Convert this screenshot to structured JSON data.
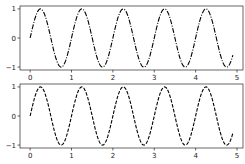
{
  "chart_data": [
    {
      "type": "line",
      "title": "",
      "xlabel": "",
      "ylabel": "",
      "xlim": [
        -0.245,
        5.145
      ],
      "ylim": [
        -1.1,
        1.1
      ],
      "xticks": [
        0,
        1,
        2,
        3,
        4,
        5
      ],
      "xtick_labels": [
        "0",
        "1",
        "2",
        "3",
        "4",
        "5"
      ],
      "yticks": [
        -1,
        0,
        1
      ],
      "ytick_labels": [
        "−1",
        "0",
        "1"
      ],
      "grid": false,
      "legend": null,
      "series": [
        {
          "name": "sin(2πx)",
          "function": "sin(2*pi*x)",
          "x_range": [
            0,
            4.9
          ],
          "linestyle": "dashdot",
          "color": "#000000"
        }
      ]
    },
    {
      "type": "line",
      "title": "",
      "xlabel": "",
      "ylabel": "",
      "xlim": [
        -0.245,
        5.145
      ],
      "ylim": [
        -1.1,
        1.1
      ],
      "xticks": [
        0,
        1,
        2,
        3,
        4,
        5
      ],
      "xtick_labels": [
        "0",
        "1",
        "2",
        "3",
        "4",
        "5"
      ],
      "yticks": [
        -1,
        0,
        1
      ],
      "ytick_labels": [
        "−1",
        "0",
        "1"
      ],
      "grid": false,
      "legend": null,
      "series": [
        {
          "name": "sin(2πx)",
          "function": "sin(2*pi*x)",
          "x_range": [
            0,
            4.9
          ],
          "linestyle": "dashed",
          "color": "#000000"
        }
      ]
    }
  ],
  "layout": {
    "axes": [
      {
        "left": 20,
        "top": 6,
        "width": 223,
        "height": 64
      },
      {
        "left": 20,
        "top": 84,
        "width": 223,
        "height": 64
      }
    ]
  }
}
